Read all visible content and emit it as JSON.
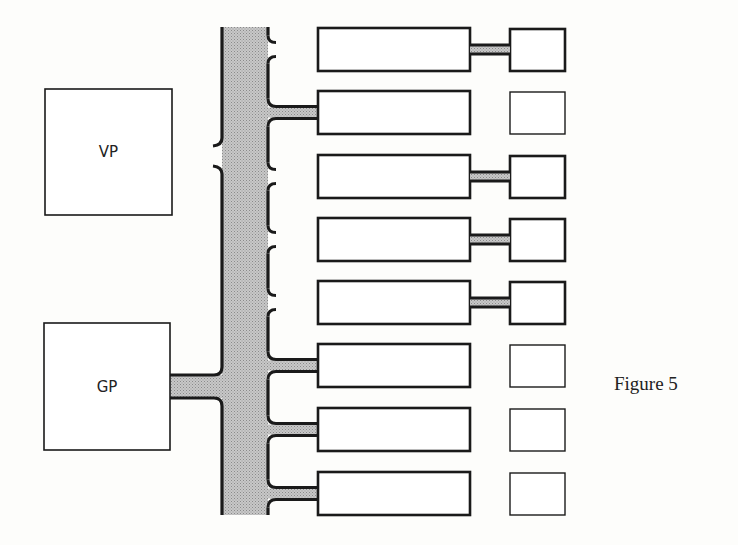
{
  "figure": {
    "caption": "Figure 5"
  },
  "processors": {
    "vp": {
      "label": "VP",
      "box": [
        45,
        89,
        127,
        126
      ]
    },
    "gp": {
      "label": "GP",
      "box": [
        44,
        323,
        126,
        127
      ],
      "connected_to_bus": true
    }
  },
  "bus": {
    "x": 222,
    "width": 46,
    "top": 27,
    "bottom": 515,
    "fill": "#bdbdbd",
    "edge": "#1a1a1a"
  },
  "rows": [
    {
      "y": 28,
      "bus_link": false,
      "unit_link": true
    },
    {
      "y": 91,
      "bus_link": true,
      "unit_link": false
    },
    {
      "y": 155,
      "bus_link": false,
      "unit_link": true
    },
    {
      "y": 218,
      "bus_link": false,
      "unit_link": true
    },
    {
      "y": 281,
      "bus_link": false,
      "unit_link": true
    },
    {
      "y": 344,
      "bus_link": true,
      "unit_link": false
    },
    {
      "y": 408,
      "bus_link": true,
      "unit_link": false
    },
    {
      "y": 472,
      "bus_link": true,
      "unit_link": false
    }
  ],
  "colors": {
    "stroke": "#1a1a1a",
    "bus_fill": "#bdbdbd",
    "background": "#fdfdfb"
  }
}
